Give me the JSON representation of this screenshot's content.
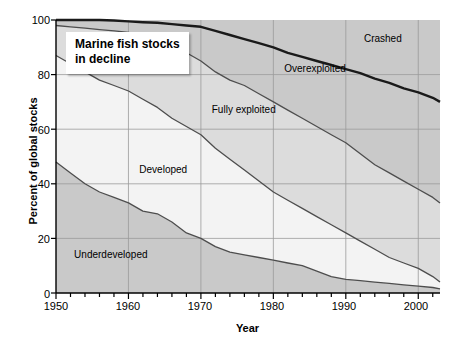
{
  "title": {
    "line1": "Marine fish stocks",
    "line2": "in decline"
  },
  "axis": {
    "ylabel": "Percent of global stocks",
    "xlabel": "Year",
    "yticks": [
      "0",
      "20",
      "40",
      "60",
      "80",
      "100"
    ],
    "xticks": [
      "1950",
      "1960",
      "1970",
      "1980",
      "1990",
      "2000"
    ]
  },
  "band_labels": {
    "underdeveloped": "Underdeveloped",
    "developed": "Developed",
    "fully_exploited": "Fully exploited",
    "overexploited": "Overexploited",
    "crashed": "Crashed"
  },
  "colors": {
    "band_dark": "#c9c9c9",
    "band_light": "#f3f3f3",
    "band_mid": "#dcdcdc",
    "axis": "#000000",
    "grid": "#9a9a9a",
    "curve": "#4d4d4d",
    "curve_thick": "#1a1a1a",
    "background": "#ffffff"
  },
  "chart_data": {
    "type": "area",
    "title": "Marine fish stocks in decline",
    "xlabel": "Year",
    "ylabel": "Percent of global stocks",
    "xlim": [
      1950,
      2003
    ],
    "ylim": [
      0,
      100
    ],
    "grid": true,
    "legend": "inline-band-labels",
    "stacking": "cumulative-boundaries",
    "x": [
      1950,
      1952,
      1954,
      1956,
      1958,
      1960,
      1962,
      1964,
      1966,
      1968,
      1970,
      1972,
      1974,
      1976,
      1978,
      1980,
      1982,
      1984,
      1986,
      1988,
      1990,
      1992,
      1994,
      1996,
      1998,
      2000,
      2002,
      2003
    ],
    "boundaries": [
      {
        "name": "Underdeveloped (upper boundary)",
        "description": "Cumulative percent at top of Underdeveloped band",
        "values": [
          48,
          44,
          40,
          37,
          35,
          33,
          30,
          29,
          26,
          22,
          20,
          17,
          15,
          14,
          13,
          12,
          11,
          10,
          8,
          6,
          5,
          4.5,
          4,
          3.5,
          3,
          2.5,
          2,
          1.5
        ]
      },
      {
        "name": "Developed (upper boundary)",
        "description": "Cumulative percent at top of Underdeveloped + Developed",
        "values": [
          87,
          84,
          81,
          78,
          76,
          74,
          71,
          68,
          64,
          61,
          58,
          53,
          49,
          45,
          41,
          37,
          34,
          31,
          28,
          25,
          22,
          19,
          16,
          13,
          11,
          9,
          6,
          4
        ]
      },
      {
        "name": "Fully exploited (upper boundary)",
        "description": "Cumulative percent at top of Underdeveloped + Developed + Fully exploited",
        "values": [
          98,
          97.5,
          97,
          96.5,
          96,
          95.5,
          94,
          92,
          90,
          88,
          85,
          81,
          78,
          76,
          73,
          70,
          67,
          64,
          61,
          58,
          55,
          51,
          47,
          44,
          41,
          38,
          35,
          33
        ]
      },
      {
        "name": "Overexploited (upper boundary) / Crashed lower boundary",
        "description": "Thick dark line: cumulative percent of all non-crashed stocks",
        "values": [
          100,
          100,
          100,
          100,
          99.8,
          99.5,
          99.2,
          99,
          98.5,
          98,
          97.5,
          96,
          94.5,
          93,
          91.5,
          90,
          88,
          86.5,
          85,
          83.5,
          82,
          80.5,
          78.5,
          77,
          75,
          73.5,
          71.5,
          70
        ]
      }
    ],
    "bands": [
      {
        "name": "Underdeveloped",
        "shade": "dark"
      },
      {
        "name": "Developed",
        "shade": "light"
      },
      {
        "name": "Fully exploited",
        "shade": "mid"
      },
      {
        "name": "Overexploited",
        "shade": "dark"
      },
      {
        "name": "Crashed",
        "shade": "dark"
      }
    ],
    "annotations": [
      {
        "label": "Underdeveloped",
        "x": 1952.5,
        "y": 14
      },
      {
        "label": "Developed",
        "x": 1961.5,
        "y": 45
      },
      {
        "label": "Fully exploited",
        "x": 1971.5,
        "y": 67
      },
      {
        "label": "Overexploited",
        "x": 1981.5,
        "y": 82
      },
      {
        "label": "Crashed",
        "x": 1992.5,
        "y": 93
      }
    ]
  }
}
